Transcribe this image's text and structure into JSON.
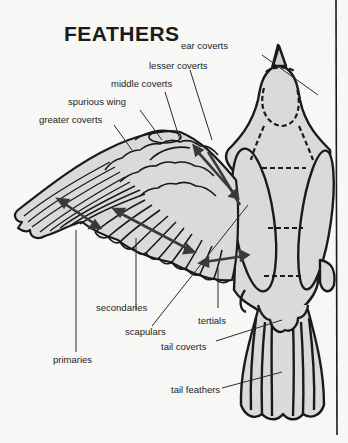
{
  "title": "FEATHERS",
  "labels": {
    "ear_coverts": "ear coverts",
    "lesser_coverts": "lesser coverts",
    "middle_coverts": "middle coverts",
    "spurious_wing": "spurious wing",
    "greater_coverts": "greater coverts",
    "secondaries": "secondaries",
    "scapulars": "scapulars",
    "tertials": "tertials",
    "primaries": "primaries",
    "tail_coverts": "tail coverts",
    "tail_feathers": "tail feathers"
  },
  "colors": {
    "background": "#f7f7f5",
    "fill": "#d9d9d9",
    "outline": "#1a1a1a",
    "arrow": "#3a3a3a"
  }
}
